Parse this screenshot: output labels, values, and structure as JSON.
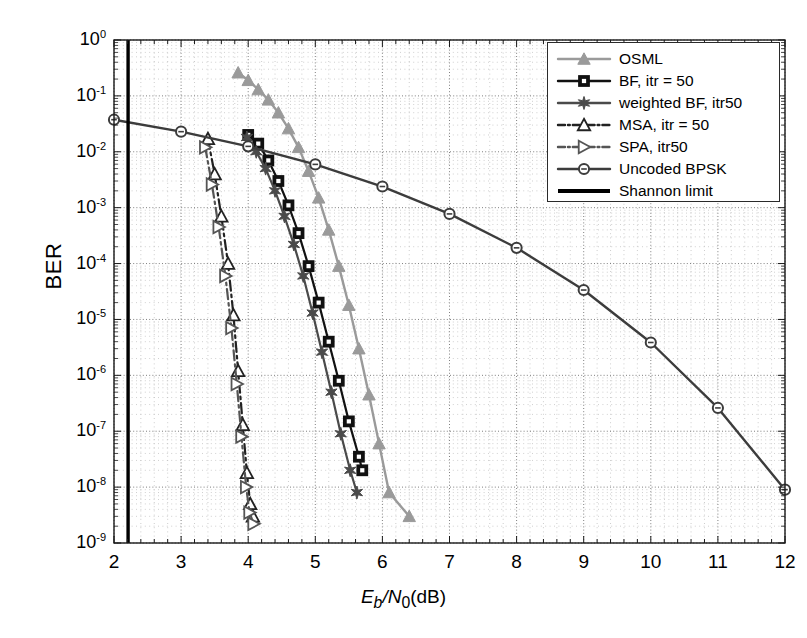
{
  "chart_data": {
    "type": "line",
    "title": "",
    "xlabel": "Eb/N0(dB)",
    "ylabel": "BER",
    "xlabel_parts": {
      "E": "E",
      "b": "b",
      "slash": "/",
      "N": "N",
      "zero": "0",
      "unit": "(dB)"
    },
    "xlim": [
      2,
      12
    ],
    "ylim": [
      1e-09,
      1
    ],
    "xscale": "linear",
    "yscale": "log",
    "grid": "both-major-and-minor-dotted",
    "legend_position": "top-right-inside",
    "xticks": [
      2,
      3,
      4,
      5,
      6,
      7,
      8,
      9,
      10,
      11,
      12
    ],
    "xtick_labels": [
      "2",
      "3",
      "4",
      "5",
      "6",
      "7",
      "8",
      "9",
      "10",
      "11",
      "12"
    ],
    "yticks": [
      1,
      0.1,
      0.01,
      0.001,
      0.0001,
      1e-05,
      1e-06,
      1e-07,
      1e-08,
      1e-09
    ],
    "ytick_labels": [
      "10^0",
      "10^-1",
      "10^-2",
      "10^-3",
      "10^-4",
      "10^-5",
      "10^-6",
      "10^-7",
      "10^-8",
      "10^-9"
    ],
    "ytick_exponents": [
      "0",
      "-1",
      "-2",
      "-3",
      "-4",
      "-5",
      "-6",
      "-7",
      "-8",
      "-9"
    ],
    "series": [
      {
        "name": "OSML",
        "color": "#9a9a9a",
        "marker": "triangle-up",
        "linestyle": "solid",
        "x": [
          3.85,
          4.0,
          4.15,
          4.3,
          4.45,
          4.6,
          4.75,
          4.9,
          5.05,
          5.2,
          5.35,
          5.5,
          5.65,
          5.8,
          5.95,
          6.1,
          6.4
        ],
        "y": [
          0.26,
          0.19,
          0.13,
          0.085,
          0.05,
          0.026,
          0.012,
          0.0045,
          0.0015,
          0.0004,
          9e-05,
          1.8e-05,
          3e-06,
          4.5e-07,
          6e-08,
          8e-09,
          3e-09
        ]
      },
      {
        "name": "BF, itr = 50",
        "color": "#111111",
        "marker": "square",
        "linestyle": "solid",
        "x": [
          4.0,
          4.15,
          4.3,
          4.45,
          4.6,
          4.75,
          4.9,
          5.05,
          5.2,
          5.35,
          5.5,
          5.65,
          5.7
        ],
        "y": [
          0.02,
          0.014,
          0.007,
          0.003,
          0.0011,
          0.00035,
          9e-05,
          2e-05,
          4e-06,
          8e-07,
          1.5e-07,
          3.5e-08,
          2e-08
        ]
      },
      {
        "name": "weighted BF, itr50",
        "color": "#4a4a4a",
        "marker": "star6",
        "linestyle": "solid",
        "x": [
          3.98,
          4.12,
          4.26,
          4.4,
          4.54,
          4.68,
          4.82,
          4.96,
          5.1,
          5.24,
          5.38,
          5.52,
          5.62
        ],
        "y": [
          0.018,
          0.01,
          0.005,
          0.002,
          0.0007,
          0.00022,
          6e-05,
          1.3e-05,
          2.6e-06,
          5e-07,
          9e-08,
          2e-08,
          8e-09
        ]
      },
      {
        "name": "MSA, itr = 50",
        "color": "#222222",
        "marker": "triangle-up-open",
        "linestyle": "dashdot",
        "x": [
          3.4,
          3.5,
          3.6,
          3.7,
          3.78,
          3.85,
          3.92,
          3.98,
          4.03,
          4.07
        ],
        "y": [
          0.017,
          0.004,
          0.0007,
          0.0001,
          1.2e-05,
          1.2e-06,
          1.3e-07,
          1.8e-08,
          5e-09,
          3e-09
        ]
      },
      {
        "name": "SPA, itr50",
        "color": "#555555",
        "marker": "triangle-right-open",
        "linestyle": "dashdot",
        "x": [
          3.36,
          3.46,
          3.56,
          3.66,
          3.75,
          3.83,
          3.9,
          3.97,
          4.02,
          4.08
        ],
        "y": [
          0.012,
          0.0026,
          0.00045,
          6e-05,
          7e-06,
          7e-07,
          8e-08,
          1e-08,
          3.5e-09,
          2.2e-09
        ]
      },
      {
        "name": "Uncoded BPSK",
        "color": "#3c3c3c",
        "marker": "circle-open",
        "linestyle": "solid",
        "x": [
          2.0,
          3.0,
          4.0,
          5.0,
          6.0,
          7.0,
          8.0,
          9.0,
          10.0,
          11.0,
          12.0
        ],
        "y": [
          0.0375,
          0.0229,
          0.0125,
          0.00595,
          0.00239,
          0.000773,
          0.000191,
          3.36e-05,
          3.87e-06,
          2.61e-07,
          9.01e-09
        ]
      },
      {
        "name": "Shannon limit",
        "color": "#000000",
        "marker": "none",
        "linestyle": "solid",
        "vertical_line_x": 2.21
      }
    ]
  },
  "legend": {
    "items": [
      {
        "label": "OSML",
        "series": 0
      },
      {
        "label": "BF, itr = 50",
        "series": 1
      },
      {
        "label": "weighted BF, itr50",
        "series": 2
      },
      {
        "label": "MSA, itr = 50",
        "series": 3
      },
      {
        "label": "SPA, itr50",
        "series": 4
      },
      {
        "label": "Uncoded BPSK",
        "series": 5
      },
      {
        "label": "Shannon limit",
        "series": 6
      }
    ]
  },
  "colors": {
    "axis": "#1a1a1a",
    "grid_major": "#7a7a7a",
    "grid_minor": "#b0b0b0",
    "background": "#ffffff"
  }
}
